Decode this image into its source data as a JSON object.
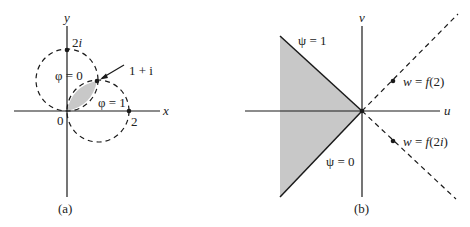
{
  "figure": {
    "panel_a": {
      "caption": "(a)",
      "x_axis_label": "x",
      "y_axis_label": "y",
      "origin_label": "0",
      "point_2i_label": "2i",
      "point_2_label": "2",
      "point_1pi_label": "1 + i",
      "phi0_label": "φ = 0",
      "phi1_label": "φ = 1"
    },
    "panel_b": {
      "caption": "(b)",
      "u_axis_label": "u",
      "v_axis_label": "v",
      "psi1_label": "ψ = 1",
      "psi0_label": "ψ = 0",
      "wf2_label": "w = f(2)",
      "wf2i_label": "w = f(2i)"
    },
    "colors": {
      "shade": "#c8c8c8",
      "line": "#1a1a1a"
    }
  }
}
